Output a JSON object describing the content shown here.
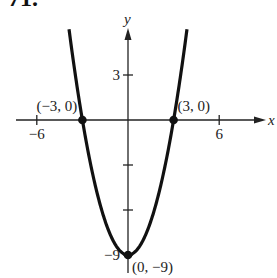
{
  "problem_number": "71.",
  "chart_data": {
    "type": "line",
    "title": "",
    "function": "y = x^2 - 9",
    "xlabel": "x",
    "ylabel": "y",
    "xlim": [
      -8,
      8
    ],
    "ylim": [
      -10,
      5.5
    ],
    "x_ticks": [
      -6,
      6
    ],
    "x_tick_labels": [
      "−6",
      "6"
    ],
    "y_ticks": [
      3,
      -3,
      -6,
      -9
    ],
    "y_tick_labels": [
      "3",
      "",
      "",
      "−9"
    ],
    "grid": false,
    "series": [
      {
        "name": "parabola",
        "x": [
          -3.9,
          -3,
          -2,
          -1,
          0,
          1,
          2,
          3,
          3.9
        ],
        "y": [
          6.2,
          0,
          -5,
          -8,
          -9,
          -8,
          -5,
          0,
          6.2
        ]
      }
    ],
    "points": [
      {
        "x": -3,
        "y": 0,
        "label": "(−3, 0)"
      },
      {
        "x": 3,
        "y": 0,
        "label": "(3, 0)"
      },
      {
        "x": 0,
        "y": -9,
        "label": "(0, −9)"
      }
    ]
  }
}
